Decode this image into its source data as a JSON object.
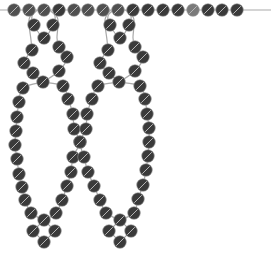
{
  "diagram": {
    "title": "",
    "type": "beading-pattern",
    "colors": {
      "background": "#ffffff",
      "thread": "#a9a9a9",
      "bead_dark": "#3a3a3a",
      "bead_mid": "#505050",
      "bead_light": "#7a7a7a"
    },
    "bead_radius": 6.3,
    "top_strand": {
      "y": 10,
      "thread_x": [
        0,
        271
      ],
      "beads": [
        {
          "x": 14,
          "shade": "mid"
        },
        {
          "x": 29,
          "shade": "mid"
        },
        {
          "x": 44,
          "shade": "mid"
        },
        {
          "x": 59,
          "shade": "dark"
        },
        {
          "x": 74,
          "shade": "mid"
        },
        {
          "x": 88,
          "shade": "mid"
        },
        {
          "x": 103,
          "shade": "mid"
        },
        {
          "x": 118,
          "shade": "mid"
        },
        {
          "x": 133,
          "shade": "dark"
        },
        {
          "x": 148,
          "shade": "dark"
        },
        {
          "x": 163,
          "shade": "dark"
        },
        {
          "x": 178,
          "shade": "dark"
        },
        {
          "x": 193,
          "shade": "light"
        },
        {
          "x": 208,
          "shade": "dark"
        },
        {
          "x": 222,
          "shade": "dark"
        },
        {
          "x": 237,
          "shade": "dark"
        }
      ]
    },
    "drops": [
      {
        "name": "left-drop",
        "top_loop": [
          [
            34,
            25
          ],
          [
            53,
            25
          ],
          [
            44,
            38
          ]
        ],
        "ring": [
          [
            32,
            50
          ],
          [
            59,
            47
          ],
          [
            67,
            57
          ],
          [
            24,
            63
          ],
          [
            33,
            73
          ],
          [
            59,
            71
          ],
          [
            43,
            82
          ]
        ],
        "left_side": [
          [
            23,
            88
          ],
          [
            19,
            102
          ],
          [
            17,
            117
          ],
          [
            16,
            131
          ],
          [
            15,
            145
          ],
          [
            17,
            159
          ],
          [
            19,
            174
          ],
          [
            22,
            187
          ],
          [
            25,
            200
          ],
          [
            31,
            213
          ]
        ],
        "right_side": [
          [
            63,
            86
          ],
          [
            68,
            99
          ],
          [
            73,
            114
          ],
          [
            74,
            129
          ],
          [
            80,
            142
          ],
          [
            73,
            157
          ],
          [
            71,
            172
          ],
          [
            67,
            186
          ],
          [
            62,
            200
          ],
          [
            56,
            213
          ]
        ],
        "bottom": [
          [
            44,
            220
          ],
          [
            33,
            231
          ],
          [
            55,
            231
          ],
          [
            44,
            242
          ]
        ]
      },
      {
        "name": "right-drop",
        "top_loop": [
          [
            110,
            25
          ],
          [
            129,
            25
          ],
          [
            120,
            38
          ]
        ],
        "ring": [
          [
            108,
            50
          ],
          [
            135,
            47
          ],
          [
            143,
            57
          ],
          [
            100,
            63
          ],
          [
            109,
            73
          ],
          [
            135,
            71
          ],
          [
            119,
            82
          ]
        ],
        "left_side": [
          [
            98,
            86
          ],
          [
            92,
            99
          ],
          [
            87,
            114
          ],
          [
            86,
            129
          ],
          [
            80,
            142
          ],
          [
            84,
            157
          ],
          [
            88,
            172
          ],
          [
            94,
            186
          ],
          [
            100,
            200
          ],
          [
            106,
            213
          ]
        ],
        "right_side": [
          [
            140,
            86
          ],
          [
            145,
            99
          ],
          [
            147,
            114
          ],
          [
            149,
            128
          ],
          [
            149,
            142
          ],
          [
            148,
            156
          ],
          [
            146,
            170
          ],
          [
            143,
            185
          ],
          [
            138,
            199
          ],
          [
            134,
            213
          ]
        ],
        "bottom": [
          [
            120,
            220
          ],
          [
            109,
            231
          ],
          [
            131,
            231
          ],
          [
            120,
            242
          ]
        ]
      }
    ]
  }
}
